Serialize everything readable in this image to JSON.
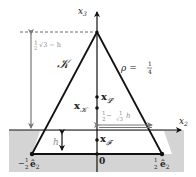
{
  "diagram": {
    "axes": {
      "vertical_label": "x",
      "vertical_sub": "3",
      "horizontal_label": "x",
      "horizontal_sub": "2"
    },
    "region_label": "𝒦",
    "rho_label": "ρ = ",
    "rho_num": "1",
    "rho_den": "4",
    "height_label_pre": "1",
    "height_label_den": "2",
    "height_label_post": "√3 − h",
    "h_label": "h",
    "width_label_a_num": "1",
    "width_label_a_den": "2",
    "width_label_mid": " − ",
    "width_label_b_num": "1",
    "width_label_b_den": "√3",
    "width_label_post": "h",
    "points": {
      "x_L": {
        "main": "x",
        "sub": "𝓛"
      },
      "x_K": {
        "main": "x",
        "sub": "𝒦"
      },
      "x_F": {
        "main": "x",
        "sub": "𝓕"
      },
      "origin": "0"
    },
    "vertices": {
      "left": {
        "sign": "−",
        "num": "1",
        "den": "2",
        "vec": "ê",
        "sub": "2"
      },
      "right": {
        "num": "1",
        "den": "2",
        "vec": "ê",
        "sub": "2"
      }
    },
    "colors": {
      "gray_region": "#d4d4d4",
      "line": "#111111",
      "annotation": "#8a8a8a"
    }
  }
}
